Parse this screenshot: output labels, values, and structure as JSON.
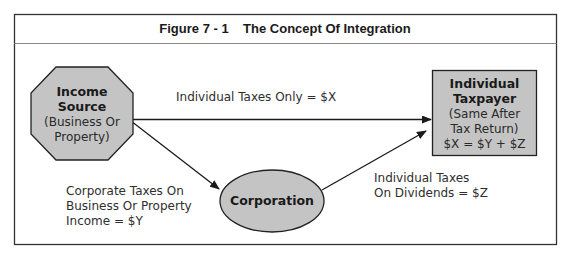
{
  "figure": {
    "title": "Figure 7 - 1    The Concept Of Integration"
  },
  "nodes": {
    "income_source": {
      "line1": "Income",
      "line2": "Source",
      "line3": "(Business Or",
      "line4": "Property)",
      "shape": "octagon"
    },
    "corporation": {
      "label": "Corporation",
      "shape": "ellipse"
    },
    "individual_taxpayer": {
      "line1": "Individual",
      "line2": "Taxpayer",
      "line3": "(Same After",
      "line4": "Tax Return)",
      "line5": "$X = $Y + $Z",
      "shape": "rectangle"
    }
  },
  "edges": {
    "direct": {
      "from": "Income Source",
      "to": "Individual Taxpayer",
      "label": "Individual Taxes Only = $X"
    },
    "to_corporation": {
      "from": "Income Source",
      "to": "Corporation",
      "line1": "Corporate Taxes On",
      "line2": "Business Or Property",
      "line3": "Income = $Y"
    },
    "dividends": {
      "from": "Corporation",
      "to": "Individual Taxpayer",
      "line1": "Individual Taxes",
      "line2": "On Dividends = $Z"
    }
  },
  "colors": {
    "node_fill": "#c4c4c4",
    "stroke": "#222222",
    "frame": "#333333",
    "divider": "#888888"
  }
}
